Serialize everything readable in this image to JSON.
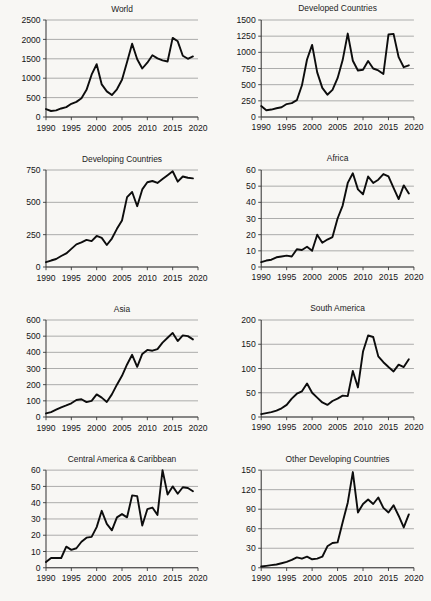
{
  "figure": {
    "background_color": "#f8f7f4",
    "line_color": "#0d0d0d",
    "grid_color": "#8d8d8d",
    "axis_color": "#3a3a3a",
    "panel_count": 8
  },
  "chart_data": [
    {
      "type": "line",
      "title": "World",
      "xlabel": "",
      "ylabel": "",
      "xlim": [
        1990,
        2020
      ],
      "ylim": [
        0,
        2500
      ],
      "xticks": [
        1990,
        1995,
        2000,
        2005,
        2010,
        2015,
        2020
      ],
      "yticks": [
        0,
        500,
        1000,
        1500,
        2000,
        2500
      ],
      "grid": true,
      "legend": "none",
      "x": [
        1990,
        1991,
        1992,
        1993,
        1994,
        1995,
        1996,
        1997,
        1998,
        1999,
        2000,
        2001,
        2002,
        2003,
        2004,
        2005,
        2006,
        2007,
        2008,
        2009,
        2010,
        2011,
        2012,
        2013,
        2014,
        2015,
        2016,
        2017,
        2018,
        2019
      ],
      "values": [
        205,
        155,
        170,
        220,
        255,
        340,
        390,
        485,
        700,
        1090,
        1360,
        840,
        660,
        565,
        715,
        960,
        1420,
        1890,
        1490,
        1250,
        1400,
        1590,
        1510,
        1460,
        1430,
        2040,
        1950,
        1580,
        1500,
        1560
      ]
    },
    {
      "type": "line",
      "title": "Developed Countries",
      "xlabel": "",
      "ylabel": "",
      "xlim": [
        1990,
        2020
      ],
      "ylim": [
        0,
        1500
      ],
      "xticks": [
        1990,
        1995,
        2000,
        2005,
        2010,
        2015,
        2020
      ],
      "yticks": [
        0,
        250,
        500,
        750,
        1000,
        1250,
        1500
      ],
      "grid": true,
      "legend": "none",
      "x": [
        1990,
        1991,
        1992,
        1993,
        1994,
        1995,
        1996,
        1997,
        1998,
        1999,
        2000,
        2001,
        2002,
        2003,
        2004,
        2005,
        2006,
        2007,
        2008,
        2009,
        2010,
        2011,
        2012,
        2013,
        2014,
        2015,
        2016,
        2017,
        2018,
        2019
      ],
      "values": [
        170,
        105,
        115,
        135,
        150,
        200,
        215,
        260,
        490,
        890,
        1115,
        690,
        450,
        345,
        420,
        600,
        880,
        1290,
        870,
        720,
        730,
        865,
        750,
        720,
        665,
        1275,
        1285,
        925,
        770,
        800
      ]
    },
    {
      "type": "line",
      "title": "Developing Countries",
      "xlabel": "",
      "ylabel": "",
      "xlim": [
        1990,
        2020
      ],
      "ylim": [
        0,
        750
      ],
      "xticks": [
        1990,
        1995,
        2000,
        2005,
        2010,
        2015,
        2020
      ],
      "yticks": [
        0,
        250,
        500,
        750
      ],
      "grid": true,
      "legend": "none",
      "x": [
        1990,
        1991,
        1992,
        1993,
        1994,
        1995,
        1996,
        1997,
        1998,
        1999,
        2000,
        2001,
        2002,
        2003,
        2004,
        2005,
        2006,
        2007,
        2008,
        2009,
        2010,
        2011,
        2012,
        2013,
        2014,
        2015,
        2016,
        2017,
        2018,
        2019
      ],
      "values": [
        37,
        50,
        62,
        85,
        105,
        140,
        175,
        190,
        210,
        200,
        240,
        225,
        170,
        220,
        295,
        360,
        540,
        580,
        470,
        600,
        655,
        665,
        650,
        680,
        710,
        740,
        660,
        700,
        690,
        685
      ]
    },
    {
      "type": "line",
      "title": "Africa",
      "xlabel": "",
      "ylabel": "",
      "xlim": [
        1990,
        2020
      ],
      "ylim": [
        0,
        60
      ],
      "xticks": [
        1990,
        1995,
        2000,
        2005,
        2010,
        2015,
        2020
      ],
      "yticks": [
        0,
        10,
        20,
        30,
        40,
        50,
        60
      ],
      "grid": true,
      "legend": "none",
      "x": [
        1990,
        1991,
        1992,
        1993,
        1994,
        1995,
        1996,
        1997,
        1998,
        1999,
        2000,
        2001,
        2002,
        2003,
        2004,
        2005,
        2006,
        2007,
        2008,
        2009,
        2010,
        2011,
        2012,
        2013,
        2014,
        2015,
        2016,
        2017,
        2018,
        2019
      ],
      "values": [
        3,
        4,
        4.5,
        6,
        6.5,
        7,
        6.5,
        11,
        10.5,
        12.5,
        10,
        20,
        15,
        17,
        18.5,
        30,
        38,
        52,
        58,
        48,
        45,
        56,
        52,
        54,
        57.5,
        56,
        49,
        42,
        50.5,
        45.5
      ]
    },
    {
      "type": "line",
      "title": "Asia",
      "xlabel": "",
      "ylabel": "",
      "xlim": [
        1990,
        2020
      ],
      "ylim": [
        0,
        600
      ],
      "xticks": [
        1990,
        1995,
        2000,
        2005,
        2010,
        2015,
        2020
      ],
      "yticks": [
        0,
        100,
        200,
        300,
        400,
        500,
        600
      ],
      "grid": true,
      "legend": "none",
      "x": [
        1990,
        1991,
        1992,
        1993,
        1994,
        1995,
        1996,
        1997,
        1998,
        1999,
        2000,
        2001,
        2002,
        2003,
        2004,
        2005,
        2006,
        2007,
        2008,
        2009,
        2010,
        2011,
        2012,
        2013,
        2014,
        2015,
        2016,
        2017,
        2018,
        2019
      ],
      "values": [
        22,
        30,
        45,
        60,
        72,
        85,
        105,
        110,
        92,
        100,
        140,
        120,
        93,
        140,
        200,
        255,
        325,
        385,
        310,
        390,
        415,
        410,
        420,
        460,
        490,
        520,
        470,
        505,
        500,
        480
      ]
    },
    {
      "type": "line",
      "title": "South America",
      "xlabel": "",
      "ylabel": "",
      "xlim": [
        1990,
        2020
      ],
      "ylim": [
        0,
        200
      ],
      "xticks": [
        1990,
        1995,
        2000,
        2005,
        2010,
        2015,
        2020
      ],
      "yticks": [
        0,
        50,
        100,
        150,
        200
      ],
      "grid": true,
      "legend": "none",
      "x": [
        1990,
        1991,
        1992,
        1993,
        1994,
        1995,
        1996,
        1997,
        1998,
        1999,
        2000,
        2001,
        2002,
        2003,
        2004,
        2005,
        2006,
        2007,
        2008,
        2009,
        2010,
        2011,
        2012,
        2013,
        2014,
        2015,
        2016,
        2017,
        2018,
        2019
      ],
      "values": [
        6,
        8,
        10,
        13,
        18,
        25,
        38,
        48,
        53,
        69,
        50,
        40,
        30,
        25,
        33,
        38,
        44,
        43,
        95,
        61,
        135,
        168,
        165,
        125,
        113,
        103,
        94,
        108,
        103,
        119
      ]
    },
    {
      "type": "line",
      "title": "Central America & Caribbean",
      "xlabel": "",
      "ylabel": "",
      "xlim": [
        1990,
        2020
      ],
      "ylim": [
        0,
        60
      ],
      "xticks": [
        1990,
        1995,
        2000,
        2005,
        2010,
        2015,
        2020
      ],
      "yticks": [
        0,
        10,
        20,
        30,
        40,
        50,
        60
      ],
      "grid": true,
      "legend": "none",
      "x": [
        1990,
        1991,
        1992,
        1993,
        1994,
        1995,
        1996,
        1997,
        1998,
        1999,
        2000,
        2001,
        2002,
        2003,
        2004,
        2005,
        2006,
        2007,
        2008,
        2009,
        2010,
        2011,
        2012,
        2013,
        2014,
        2015,
        2016,
        2017,
        2018,
        2019
      ],
      "values": [
        3.5,
        6,
        6,
        6,
        13,
        11,
        12,
        16,
        18.5,
        19,
        25,
        35,
        27,
        23,
        31,
        33,
        31,
        44.5,
        44,
        26,
        36,
        37,
        32.5,
        60,
        45,
        50,
        45.5,
        49.5,
        49,
        47
      ]
    },
    {
      "type": "line",
      "title": "Other Developing Countries",
      "xlabel": "",
      "ylabel": "",
      "xlim": [
        1990,
        2020
      ],
      "ylim": [
        0,
        150
      ],
      "xticks": [
        1990,
        1995,
        2000,
        2005,
        2010,
        2015,
        2020
      ],
      "yticks": [
        0,
        30,
        60,
        90,
        120,
        150
      ],
      "grid": true,
      "legend": "none",
      "x": [
        1990,
        1991,
        1992,
        1993,
        1994,
        1995,
        1996,
        1997,
        1998,
        1999,
        2000,
        2001,
        2002,
        2003,
        2004,
        2005,
        2006,
        2007,
        2008,
        2009,
        2010,
        2011,
        2012,
        2013,
        2014,
        2015,
        2016,
        2017,
        2018,
        2019
      ],
      "values": [
        2,
        3,
        4,
        5,
        7,
        9,
        12,
        16,
        14,
        17,
        13,
        14,
        17,
        33,
        38,
        39,
        70,
        100,
        147,
        85,
        98,
        105,
        98,
        108,
        92,
        85,
        96,
        80,
        62,
        82
      ]
    }
  ]
}
